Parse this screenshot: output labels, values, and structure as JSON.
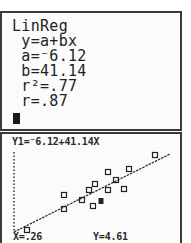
{
  "device": "TI graphing calculator",
  "home_screen": {
    "lines": [
      "LinReg",
      " y=a+bx",
      " a=⁻6.12",
      " b=41.14",
      " r²=.77",
      " r=.87"
    ],
    "cursor": "block-cursor"
  },
  "graph_screen": {
    "equation_label": "Y1=⁻6.12+41.14X",
    "trace_x_label": "X=.26",
    "trace_y_label": "Y=4.61",
    "regression": {
      "a": -6.12,
      "b": 41.14,
      "r2": 0.77,
      "r": 0.87
    },
    "trace": {
      "x": 0.26,
      "y": 4.61
    }
  },
  "chart_data": {
    "type": "scatter",
    "xlabel": "",
    "ylabel": "",
    "grid": false,
    "points_px": [
      [
        153,
        153
      ],
      [
        127,
        167
      ],
      [
        106,
        170
      ],
      [
        114,
        178
      ],
      [
        93,
        182
      ],
      [
        87,
        188
      ],
      [
        106,
        188
      ],
      [
        122,
        187
      ],
      [
        62,
        193
      ],
      [
        80,
        198
      ],
      [
        91,
        204
      ],
      [
        62,
        207
      ],
      [
        25,
        228
      ]
    ],
    "trace_point_px": [
      99,
      199
    ],
    "regression_line_px": [
      [
        12,
        230
      ],
      [
        168,
        152
      ]
    ],
    "y_axis_px": {
      "x": 12,
      "y_top": 150,
      "y_bottom": 230
    },
    "regression": {
      "equation": "y=a+bx",
      "a": -6.12,
      "b": 41.14,
      "r2": 0.77,
      "r": 0.87
    },
    "trace": {
      "x": 0.26,
      "y": 4.61
    }
  }
}
